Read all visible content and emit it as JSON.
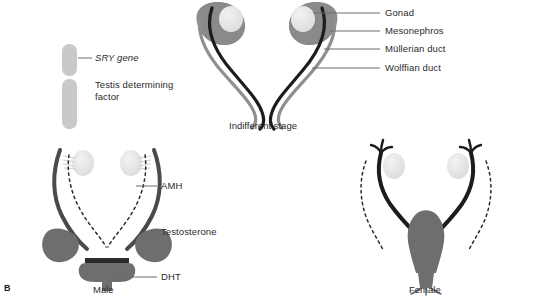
{
  "figure": {
    "panel_letter": "B",
    "colors": {
      "duct_wolffian": "#1c1c1c",
      "duct_mullerian": "#8f8f8f",
      "mesonephros_gray": "#8a8a8a",
      "gonad_light": "#e2e2e2",
      "organ_gray": "#6e6e6e",
      "chromosome_gray": "#c9c9c9",
      "leader_line": "#6d6d6d",
      "text": "#2b2b2b"
    }
  },
  "legend": {
    "chromosome": {
      "name": "chromosome",
      "short_arm_label": "SRY gene",
      "long_arm_label_line1": "Testis determining",
      "long_arm_label_line2": "factor"
    }
  },
  "indifferent": {
    "caption": "Indifferent stage",
    "labels": [
      "Gonad",
      "Mesonephros",
      "Müllerian duct",
      "Wolffian duct"
    ]
  },
  "male": {
    "caption": "Male",
    "labels": [
      "AMH",
      "Testosterone",
      "DHT"
    ]
  },
  "female": {
    "caption": "Female"
  }
}
